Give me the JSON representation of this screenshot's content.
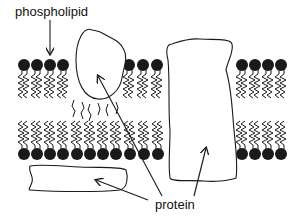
{
  "diagram": {
    "labels": {
      "phospholipid": "phospholipid",
      "protein": "protein"
    },
    "colors": {
      "head": "#1a1a1a",
      "line": "#1a1a1a",
      "background": "#ffffff"
    }
  }
}
